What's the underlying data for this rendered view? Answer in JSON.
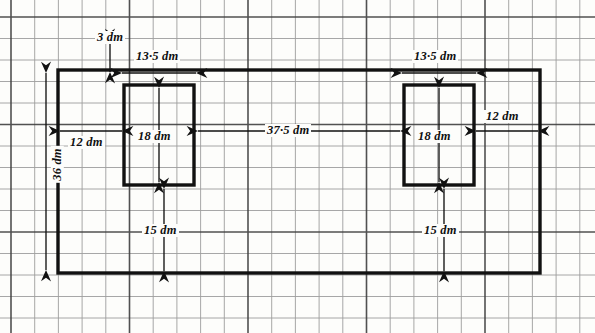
{
  "figure": {
    "unit": "dm",
    "stroke_color": "#111111",
    "grid_minor_color": "#8d8d8d",
    "grid_major_color": "#4a4a4a",
    "background_color": "#fdfdfb"
  },
  "grid": {
    "minor_step_x": 23.7,
    "minor_step_y": 21.5,
    "major_every": 5,
    "origin_x": 11,
    "origin_y": 17
  },
  "shapes": {
    "outer_rectangle": {
      "name": "outer-plate",
      "x1": 58,
      "y1": 70,
      "x2": 540,
      "y2": 273,
      "width_dm": 75,
      "height_dm": 36
    },
    "inner_rectangles": [
      {
        "name": "left-cutout",
        "x1": 124,
        "y1": 85,
        "x2": 194,
        "y2": 185,
        "width_dm": 13.5,
        "height_dm": 18
      },
      {
        "name": "right-cutout",
        "x1": 404,
        "y1": 85,
        "x2": 474,
        "y2": 185,
        "width_dm": 13.5,
        "height_dm": 18
      }
    ]
  },
  "dimensions": [
    {
      "id": "top-offset",
      "label": "3 dm",
      "value": 3,
      "orientation": "vertical",
      "label_x": 95,
      "label_y": 31
    },
    {
      "id": "left-cutout-width",
      "label": "13·5 dm",
      "value": 13.5,
      "orientation": "horizontal",
      "label_x": 134,
      "label_y": 50
    },
    {
      "id": "right-cutout-width",
      "label": "13·5 dm",
      "value": 13.5,
      "orientation": "horizontal",
      "label_x": 412,
      "label_y": 50
    },
    {
      "id": "left-edge-gap",
      "label": "12 dm",
      "value": 12,
      "orientation": "horizontal",
      "label_x": 68,
      "label_y": 136
    },
    {
      "id": "right-edge-gap",
      "label": "12 dm",
      "value": 12,
      "orientation": "horizontal",
      "label_x": 484,
      "label_y": 110
    },
    {
      "id": "left-cutout-height",
      "label": "18 dm",
      "value": 18,
      "orientation": "vertical",
      "label_x": 136,
      "label_y": 130
    },
    {
      "id": "right-cutout-height",
      "label": "18 dm",
      "value": 18,
      "orientation": "vertical",
      "label_x": 416,
      "label_y": 130
    },
    {
      "id": "cutout-spacing",
      "label": "37·5 dm",
      "value": 37.5,
      "orientation": "horizontal",
      "label_x": 265,
      "label_y": 124
    },
    {
      "id": "plate-height",
      "label": "36 dm",
      "value": 36,
      "orientation": "vertical-rotated",
      "label_x": 39,
      "label_y": 158
    },
    {
      "id": "left-bottom-gap",
      "label": "15 dm",
      "value": 15,
      "orientation": "vertical",
      "label_x": 142,
      "label_y": 224
    },
    {
      "id": "right-bottom-gap",
      "label": "15 dm",
      "value": 15,
      "orientation": "vertical",
      "label_x": 422,
      "label_y": 224
    }
  ]
}
